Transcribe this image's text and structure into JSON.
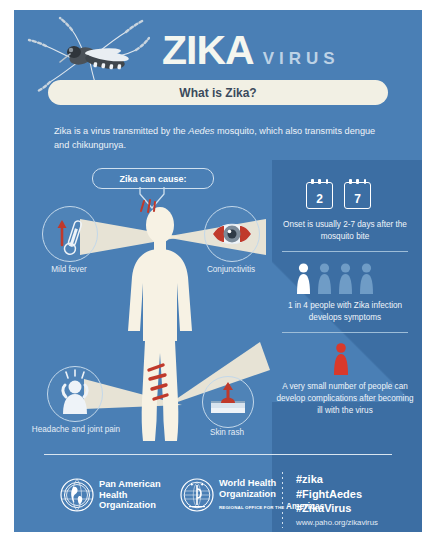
{
  "poster": {
    "background_color": "#4a7fb5",
    "accent_dark": "#3c6ea3",
    "banner_color": "#f2f0e4",
    "alert_color": "#d8392b"
  },
  "header": {
    "title_main": "ZIKA",
    "title_sub": "VIRUS",
    "mosquito_icon": "aedes-mosquito-photo",
    "banner_label": "What is Zika?"
  },
  "intro": {
    "line_1_before": "Zika is a virus transmitted by the ",
    "line_1_italic": "Aedes",
    "line_1_after": " mosquito, which also transmits dengue and chikungunya."
  },
  "diagram": {
    "callout_label": "Zika can cause:",
    "body_icon": "human-body-silhouette",
    "symptoms": [
      {
        "label": "Mild fever",
        "icon": "thermometer-up-arrow-icon"
      },
      {
        "label": "Conjunctivitis",
        "icon": "inflamed-eye-icon"
      },
      {
        "label": "Headache and joint pain",
        "icon": "person-headache-icon"
      },
      {
        "label": "Skin rash",
        "icon": "skin-rash-bump-icon"
      }
    ]
  },
  "facts": [
    {
      "id": "onset",
      "icon": "calendar-icon",
      "calendar_values": [
        "2",
        "7"
      ],
      "text": "Onset is usually 2-7 days after the mosquito bite"
    },
    {
      "id": "symptom-ratio",
      "icon": "people-group-icon",
      "people_total": 4,
      "people_highlighted": 1,
      "text": "1 in 4 people with Zika infection develops symptoms"
    },
    {
      "id": "complications",
      "icon": "single-person-red-icon",
      "text": "A very small number of people can develop complications after becoming ill with the virus"
    }
  ],
  "footer": {
    "logos": [
      {
        "icon": "paho-globe-logo",
        "name_line_1": "Pan American",
        "name_line_2": "Health",
        "name_line_3": "Organization",
        "sub_small": "",
        "sub_bold": ""
      },
      {
        "icon": "who-emblem-logo",
        "name_line_1": "World Health",
        "name_line_2": "Organization",
        "name_line_3": "",
        "sub_small": "REGIONAL OFFICE FOR THE",
        "sub_bold": "Americas"
      }
    ],
    "hashtags": [
      "#zika",
      "#FightAedes",
      "#ZikaVirus"
    ],
    "url": "www.paho.org/zikavirus"
  }
}
